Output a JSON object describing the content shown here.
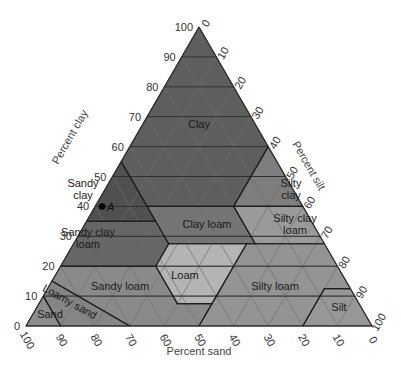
{
  "diagram": {
    "axes": {
      "clay": {
        "label": "Percent clay",
        "ticks": [
          "0",
          "10",
          "20",
          "30",
          "40",
          "50",
          "60",
          "70",
          "80",
          "90",
          "100"
        ]
      },
      "silt": {
        "label": "Percent silt",
        "ticks": [
          "0",
          "10",
          "20",
          "30",
          "40",
          "50",
          "60",
          "70",
          "80",
          "90",
          "100"
        ]
      },
      "sand": {
        "label": "Percent sand",
        "ticks": [
          "100",
          "90",
          "80",
          "70",
          "60",
          "50",
          "40",
          "30",
          "20",
          "10",
          "0"
        ]
      }
    },
    "colors": {
      "clay": "#5e5e5e",
      "sandy_clay": "#505050",
      "silty_clay": "#7e7e7e",
      "sandy_clay_loam": "#666666",
      "clay_loam": "#757575",
      "silty_clay_loam": "#9a9a9a",
      "loam": "#b4b4b4",
      "sandy_loam": "#8a8a8a",
      "silty_loam": "#949494",
      "loamy_sand": "#858585",
      "sand": "#8c8c8c",
      "silt": "#979797",
      "grid": "#6f6f6f",
      "boundary": "#1f1f1f"
    },
    "regions": [
      {
        "name": "Clay",
        "key": "clay",
        "label": [
          "Clay"
        ],
        "label_pos": [
          199,
          128
        ],
        "points": [
          [
            0,
            0,
            100
          ],
          [
            45,
            0,
            55
          ],
          [
            45,
            15,
            40
          ],
          [
            20,
            40,
            40
          ],
          [
            0,
            40,
            60
          ]
        ]
      },
      {
        "name": "Sandy clay",
        "key": "sandy_clay",
        "label": [
          "Sandy",
          "clay"
        ],
        "label_pos": [
          83,
          193
        ],
        "points": [
          [
            45,
            0,
            55
          ],
          [
            65,
            0,
            35
          ],
          [
            45,
            20,
            35
          ]
        ]
      },
      {
        "name": "Silty clay",
        "key": "silty_clay",
        "label": [
          "Silty",
          "clay"
        ],
        "label_pos": [
          291,
          193
        ],
        "points": [
          [
            0,
            40,
            60
          ],
          [
            20,
            40,
            40
          ],
          [
            0,
            60,
            40
          ]
        ]
      },
      {
        "name": "Sandy clay loam",
        "key": "sandy_clay_loam",
        "label": [
          "Sandy clay",
          "loam"
        ],
        "label_pos": [
          88,
          242
        ],
        "points": [
          [
            65,
            0,
            35
          ],
          [
            45,
            20,
            35
          ],
          [
            45,
            27.5,
            27.5
          ],
          [
            52.5,
            27.5,
            20
          ],
          [
            80,
            0,
            20
          ]
        ]
      },
      {
        "name": "Clay loam",
        "key": "clay_loam",
        "label": [
          "Clay loam"
        ],
        "label_pos": [
          207,
          228
        ],
        "points": [
          [
            45,
            15,
            40
          ],
          [
            20,
            40,
            40
          ],
          [
            20,
            52.5,
            27.5
          ],
          [
            45,
            27.5,
            27.5
          ],
          [
            45,
            20,
            35
          ]
        ]
      },
      {
        "name": "Silty clay loam",
        "key": "silty_clay_loam",
        "label": [
          "Silty clay",
          "loam"
        ],
        "label_pos": [
          295,
          228
        ],
        "points": [
          [
            20,
            40,
            40
          ],
          [
            0,
            60,
            40
          ],
          [
            0,
            72.5,
            27.5
          ],
          [
            20,
            52.5,
            27.5
          ]
        ]
      },
      {
        "name": "Loam",
        "key": "loam",
        "label": [
          "Loam"
        ],
        "label_pos": [
          185,
          279
        ],
        "points": [
          [
            52.5,
            27.5,
            20
          ],
          [
            45,
            27.5,
            27.5
          ],
          [
            22.5,
            50,
            27.5
          ],
          [
            22.5,
            50,
            27.5
          ],
          [
            42.5,
            50,
            7.5
          ],
          [
            52.5,
            40,
            7.5
          ]
        ]
      },
      {
        "name": "Sandy loam",
        "key": "sandy_loam",
        "label": [
          "Sandy loam"
        ],
        "label_pos": [
          120,
          290
        ],
        "points": [
          [
            80,
            0,
            20
          ],
          [
            52.5,
            27.5,
            20
          ],
          [
            52.5,
            40,
            7.5
          ],
          [
            42.5,
            50,
            7.5
          ],
          [
            50,
            50,
            0
          ],
          [
            70,
            30,
            0
          ],
          [
            85,
            0,
            15
          ]
        ]
      },
      {
        "name": "Silty loam",
        "key": "silty_loam",
        "label": [
          "Silty loam"
        ],
        "label_pos": [
          275,
          290
        ],
        "points": [
          [
            22.5,
            50,
            27.5
          ],
          [
            0,
            72.5,
            27.5
          ],
          [
            0,
            87.5,
            12.5
          ],
          [
            7.5,
            80,
            12.5
          ],
          [
            20,
            80,
            0
          ],
          [
            50,
            50,
            0
          ],
          [
            42.5,
            50,
            7.5
          ]
        ]
      },
      {
        "name": "Silt",
        "key": "silt",
        "label": [
          "Silt"
        ],
        "label_pos": [
          339,
          311
        ],
        "points": [
          [
            7.5,
            80,
            12.5
          ],
          [
            0,
            87.5,
            12.5
          ],
          [
            0,
            100,
            0
          ],
          [
            20,
            80,
            0
          ]
        ]
      },
      {
        "name": "Loamy sand",
        "key": "loamy_sand",
        "label": [
          "Loamy sand"
        ],
        "label_pos": [
          68,
          305
        ],
        "points": [
          [
            85,
            0,
            15
          ],
          [
            70,
            30,
            0
          ],
          [
            90,
            10,
            0
          ],
          [
            90,
            0,
            10
          ]
        ]
      },
      {
        "name": "Sand",
        "key": "sand",
        "label": [
          "Sand"
        ],
        "label_pos": [
          50,
          318
        ],
        "points": [
          [
            90,
            0,
            10
          ],
          [
            90,
            10,
            0
          ],
          [
            100,
            0,
            0
          ]
        ]
      }
    ],
    "point_a": {
      "label": "A",
      "sand": 58,
      "silt": 2,
      "clay": 40
    }
  }
}
